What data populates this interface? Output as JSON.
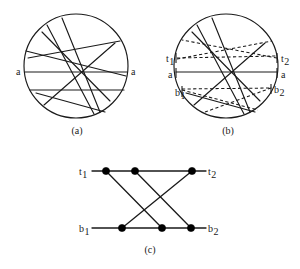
{
  "figure": {
    "background_color": "#ffffff",
    "line_color": "#1a1a1a",
    "node_color": "#000000"
  },
  "panels": [
    {
      "id": "a",
      "caption": "(a)",
      "caption_x": 77,
      "caption_y": 134,
      "circle": {
        "cx": 76,
        "cy": 66,
        "r": 52
      },
      "labels": [
        {
          "name": "label-a-left",
          "text": "a",
          "sub": "",
          "x": 16,
          "y": 75,
          "anchor": "start"
        },
        {
          "name": "label-a-right",
          "text": "a",
          "sub": "",
          "x": 131,
          "y": 75,
          "anchor": "start"
        }
      ],
      "chords": [
        {
          "name": "chord-a-horizontal-main",
          "style": "solid",
          "x1": 25,
          "y1": 72,
          "x2": 127,
          "y2": 72
        },
        {
          "name": "chord-a-horizontal-lower",
          "style": "solid",
          "x1": 30,
          "y1": 90,
          "x2": 124,
          "y2": 90
        },
        {
          "name": "chord-a-upper-slant-long",
          "style": "solid",
          "x1": 26,
          "y1": 51,
          "x2": 126,
          "y2": 76
        },
        {
          "name": "chord-a-upper-slant-short",
          "style": "solid",
          "x1": 28,
          "y1": 58,
          "x2": 120,
          "y2": 41
        },
        {
          "name": "chord-a-steep-left",
          "style": "solid",
          "x1": 47,
          "y1": 25,
          "x2": 94,
          "y2": 114
        },
        {
          "name": "chord-a-steep-right",
          "style": "solid",
          "x1": 62,
          "y1": 18,
          "x2": 100,
          "y2": 112
        },
        {
          "name": "chord-a-diagonal-down",
          "style": "solid",
          "x1": 42,
          "y1": 32,
          "x2": 110,
          "y2": 101
        },
        {
          "name": "chord-a-diagonal-up",
          "style": "solid",
          "x1": 44,
          "y1": 105,
          "x2": 115,
          "y2": 43
        },
        {
          "name": "chord-a-bottom-slant",
          "style": "solid",
          "x1": 36,
          "y1": 93,
          "x2": 105,
          "y2": 112
        }
      ]
    },
    {
      "id": "b",
      "caption": "(b)",
      "caption_x": 228,
      "caption_y": 134,
      "circle": {
        "cx": 226,
        "cy": 66,
        "r": 52
      },
      "labels": [
        {
          "name": "label-t1",
          "text": "t",
          "sub": "1",
          "x": 166,
          "y": 62,
          "anchor": "start"
        },
        {
          "name": "label-t2",
          "text": "t",
          "sub": "2",
          "x": 281,
          "y": 62,
          "anchor": "start"
        },
        {
          "name": "label-b-a-left",
          "text": "a",
          "sub": "",
          "x": 168,
          "y": 78,
          "anchor": "start"
        },
        {
          "name": "label-b-a-right",
          "text": "a",
          "sub": "",
          "x": 281,
          "y": 78,
          "anchor": "start"
        },
        {
          "name": "label-b1",
          "text": "b",
          "sub": "1",
          "x": 175,
          "y": 96,
          "anchor": "start"
        },
        {
          "name": "label-b2",
          "text": "b",
          "sub": "2",
          "x": 274,
          "y": 93,
          "anchor": "start"
        }
      ],
      "ticks": [
        {
          "name": "tick-t1",
          "x1": 176,
          "y1": 53,
          "x2": 176,
          "y2": 63
        },
        {
          "name": "tick-t2",
          "x1": 277,
          "y1": 53,
          "x2": 277,
          "y2": 63
        },
        {
          "name": "tick-a-left",
          "x1": 176,
          "y1": 68,
          "x2": 176,
          "y2": 78
        },
        {
          "name": "tick-a-right",
          "x1": 277,
          "y1": 68,
          "x2": 277,
          "y2": 78
        },
        {
          "name": "tick-b1",
          "x1": 182,
          "y1": 86,
          "x2": 182,
          "y2": 97
        },
        {
          "name": "tick-b2",
          "x1": 271,
          "y1": 84,
          "x2": 271,
          "y2": 94
        }
      ],
      "chords": [
        {
          "name": "chord-b-a-to-a",
          "style": "solid",
          "x1": 176,
          "y1": 72,
          "x2": 277,
          "y2": 72
        },
        {
          "name": "chord-b-t1-to-t2",
          "style": "dashed",
          "x1": 177,
          "y1": 58,
          "x2": 277,
          "y2": 56
        },
        {
          "name": "chord-b-b1-to-b2",
          "style": "dashed",
          "x1": 182,
          "y1": 89,
          "x2": 272,
          "y2": 88
        },
        {
          "name": "chord-b-t1-to-upper-right",
          "style": "dashed",
          "x1": 177,
          "y1": 59,
          "x2": 272,
          "y2": 41
        },
        {
          "name": "chord-b-t2-to-upper-left",
          "style": "dashed",
          "x1": 277,
          "y1": 58,
          "x2": 182,
          "y2": 40
        },
        {
          "name": "chord-b-b1-to-lower-right",
          "style": "dashed",
          "x1": 182,
          "y1": 90,
          "x2": 258,
          "y2": 110
        },
        {
          "name": "chord-b-b2-to-lower-left",
          "style": "dashed",
          "x1": 271,
          "y1": 88,
          "x2": 205,
          "y2": 112
        },
        {
          "name": "chord-b-steep-left",
          "style": "solid",
          "x1": 197,
          "y1": 25,
          "x2": 244,
          "y2": 114
        },
        {
          "name": "chord-b-steep-right",
          "style": "solid",
          "x1": 212,
          "y1": 18,
          "x2": 250,
          "y2": 112
        },
        {
          "name": "chord-b-diagonal-down",
          "style": "solid",
          "x1": 192,
          "y1": 32,
          "x2": 260,
          "y2": 101
        },
        {
          "name": "chord-b-diagonal-up",
          "style": "solid",
          "x1": 194,
          "y1": 105,
          "x2": 265,
          "y2": 43
        },
        {
          "name": "chord-b-bottom-slant",
          "style": "solid",
          "x1": 186,
          "y1": 93,
          "x2": 255,
          "y2": 112
        }
      ]
    },
    {
      "id": "c",
      "caption": "(c)",
      "caption_x": 150,
      "caption_y": 253,
      "labels": [
        {
          "name": "label-c-t1",
          "text": "t",
          "sub": "1",
          "x": 79,
          "y": 175,
          "anchor": "start"
        },
        {
          "name": "label-c-t2",
          "text": "t",
          "sub": "2",
          "x": 208,
          "y": 175,
          "anchor": "start"
        },
        {
          "name": "label-c-b1",
          "text": "b",
          "sub": "1",
          "x": 79,
          "y": 232,
          "anchor": "start"
        },
        {
          "name": "label-c-b2",
          "text": "b",
          "sub": "2",
          "x": 208,
          "y": 232,
          "anchor": "start"
        }
      ],
      "nodes": [
        {
          "name": "node-top-1",
          "id": "T1",
          "cx": 106,
          "cy": 171,
          "r": 3.6
        },
        {
          "name": "node-top-2",
          "id": "T2",
          "cx": 135,
          "cy": 171,
          "r": 3.6
        },
        {
          "name": "node-top-3",
          "id": "T3",
          "cx": 192,
          "cy": 171,
          "r": 3.6
        },
        {
          "name": "node-bottom-1",
          "id": "B1",
          "cx": 122,
          "cy": 228,
          "r": 3.6
        },
        {
          "name": "node-bottom-2",
          "id": "B2",
          "cx": 162,
          "cy": 228,
          "r": 3.6
        },
        {
          "name": "node-bottom-3",
          "id": "B3",
          "cx": 191,
          "cy": 228,
          "r": 3.6
        }
      ],
      "edges": [
        {
          "name": "edge-t1-stub",
          "x1": 92,
          "y1": 171,
          "x2": 106,
          "y2": 171
        },
        {
          "name": "edge-top-rail-1",
          "x1": 106,
          "y1": 171,
          "x2": 135,
          "y2": 171
        },
        {
          "name": "edge-top-rail-2",
          "x1": 135,
          "y1": 171,
          "x2": 192,
          "y2": 171
        },
        {
          "name": "edge-t2-stub",
          "x1": 192,
          "y1": 171,
          "x2": 206,
          "y2": 171
        },
        {
          "name": "edge-b1-stub",
          "x1": 92,
          "y1": 228,
          "x2": 122,
          "y2": 228
        },
        {
          "name": "edge-bottom-rail-1",
          "x1": 122,
          "y1": 228,
          "x2": 162,
          "y2": 228
        },
        {
          "name": "edge-bottom-rail-2",
          "x1": 162,
          "y1": 228,
          "x2": 191,
          "y2": 228
        },
        {
          "name": "edge-b2-stub",
          "x1": 191,
          "y1": 228,
          "x2": 206,
          "y2": 228
        },
        {
          "name": "edge-cross-t1-b2",
          "x1": 106,
          "y1": 171,
          "x2": 162,
          "y2": 228
        },
        {
          "name": "edge-cross-t2-b3",
          "x1": 135,
          "y1": 171,
          "x2": 191,
          "y2": 228
        },
        {
          "name": "edge-cross-t3-b1",
          "x1": 192,
          "y1": 171,
          "x2": 122,
          "y2": 228
        }
      ]
    }
  ]
}
